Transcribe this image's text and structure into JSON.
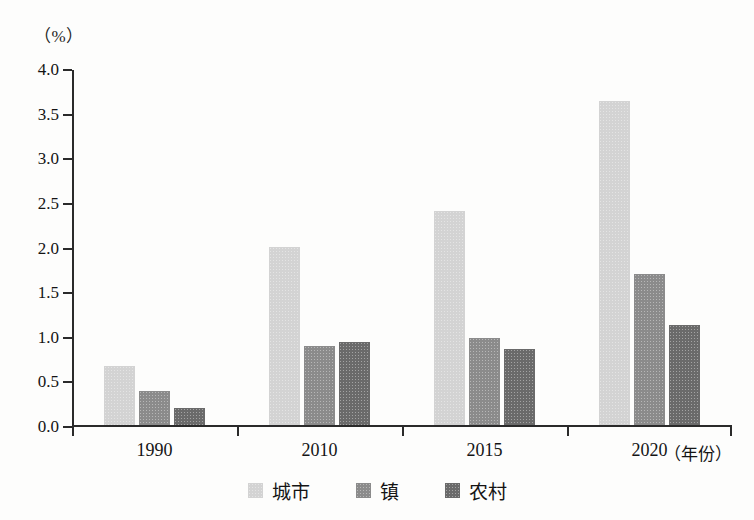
{
  "chart_data": {
    "type": "bar",
    "title": "",
    "subtitle": "",
    "xlabel": "（年份）",
    "ylabel": "（%）",
    "categories": [
      "1990",
      "2010",
      "2015",
      "2020"
    ],
    "series": [
      {
        "name": "城市",
        "values": [
          0.66,
          2.0,
          2.4,
          3.63
        ],
        "color": "#d3d3d3"
      },
      {
        "name": "镇",
        "values": [
          0.38,
          0.89,
          0.97,
          1.69
        ],
        "color": "#8b8b8b"
      },
      {
        "name": "农村",
        "values": [
          0.19,
          0.93,
          0.85,
          1.12
        ],
        "color": "#6a6a6a"
      }
    ],
    "ylim": [
      0.0,
      4.0
    ],
    "ytick_step": 0.5,
    "yticks": [
      "0.0",
      "0.5",
      "1.0",
      "1.5",
      "2.0",
      "2.5",
      "3.0",
      "3.5",
      "4.0"
    ],
    "grid": false,
    "legend_position": "bottom-center",
    "axis_color": "#2a2a2a"
  },
  "legend": {
    "items": [
      {
        "label": "城市",
        "color": "#d3d3d3"
      },
      {
        "label": "镇",
        "color": "#8b8b8b"
      },
      {
        "label": "农村",
        "color": "#6a6a6a"
      }
    ]
  }
}
